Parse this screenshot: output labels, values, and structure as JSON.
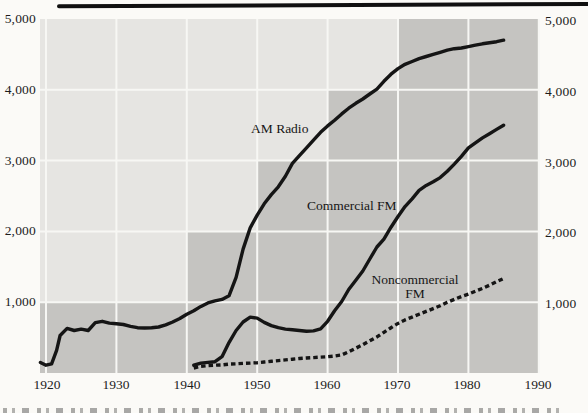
{
  "figure": {
    "description": "Scanned textbook line chart of U.S. radio stations by type, 1920-1990",
    "top_rule_color": "#101010"
  },
  "chart_data": {
    "type": "line",
    "title": "",
    "xlabel": "",
    "ylabel": "",
    "xlim": [
      1919,
      1990
    ],
    "ylim": [
      0,
      5000
    ],
    "grid": "white gridlines at each decade and each 1,000",
    "legend_position": "inline curve annotations",
    "x_ticks": [
      "1920",
      "1930",
      "1940",
      "1950",
      "1960",
      "1970",
      "1980",
      "1990"
    ],
    "x_tick_years": [
      1920,
      1930,
      1940,
      1950,
      1960,
      1970,
      1980,
      1990
    ],
    "y_ticks_left": [
      "5,000",
      "4,000",
      "3,000",
      "2,000",
      "1,000"
    ],
    "y_ticks_right": [
      "5,000",
      "4,000",
      "3,000",
      "2,000",
      "1,000"
    ],
    "y_tick_values": [
      5000,
      4000,
      3000,
      2000,
      1000
    ],
    "gridline_years": [
      1920,
      1930,
      1940,
      1950,
      1960,
      1970,
      1980,
      1990
    ],
    "gridline_values": [
      1000,
      2000,
      3000,
      4000
    ],
    "colors": {
      "plot_light": "#e6e5e2",
      "plot_dark": "#c5c4c1",
      "gridline": "#f7f7f4",
      "line": "#151515",
      "page": "#fbfaf7",
      "text": "#1c1c1c"
    },
    "background_steps": [
      {
        "band_low": 0,
        "band_high": 1000,
        "start_year": 1919
      },
      {
        "band_low": 1000,
        "band_high": 2000,
        "start_year": 1940
      },
      {
        "band_low": 2000,
        "band_high": 3000,
        "start_year": 1950
      },
      {
        "band_low": 3000,
        "band_high": 4000,
        "start_year": 1960
      },
      {
        "band_low": 4000,
        "band_high": 5000,
        "start_year": 1970
      }
    ],
    "annotations": [
      {
        "text": "AM Radio"
      },
      {
        "text": "Commercial FM"
      },
      {
        "text": "Noncommercial"
      },
      {
        "text": "FM"
      }
    ],
    "series": [
      {
        "name": "AM Radio",
        "line_style": "solid",
        "points": [
          [
            1919.2,
            150
          ],
          [
            1920,
            110
          ],
          [
            1920.8,
            130
          ],
          [
            1921.5,
            320
          ],
          [
            1922,
            530
          ],
          [
            1923,
            630
          ],
          [
            1924,
            600
          ],
          [
            1925,
            620
          ],
          [
            1926,
            600
          ],
          [
            1927,
            710
          ],
          [
            1928,
            730
          ],
          [
            1929,
            705
          ],
          [
            1930,
            695
          ],
          [
            1931,
            685
          ],
          [
            1932,
            660
          ],
          [
            1933,
            640
          ],
          [
            1934,
            635
          ],
          [
            1935,
            640
          ],
          [
            1936,
            650
          ],
          [
            1937,
            680
          ],
          [
            1938,
            720
          ],
          [
            1939,
            770
          ],
          [
            1940,
            830
          ],
          [
            1941,
            880
          ],
          [
            1942,
            940
          ],
          [
            1943,
            990
          ],
          [
            1944,
            1020
          ],
          [
            1945,
            1040
          ],
          [
            1946,
            1090
          ],
          [
            1947,
            1350
          ],
          [
            1948,
            1750
          ],
          [
            1949,
            2050
          ],
          [
            1950,
            2230
          ],
          [
            1951,
            2390
          ],
          [
            1952,
            2520
          ],
          [
            1953,
            2630
          ],
          [
            1954,
            2780
          ],
          [
            1955,
            2960
          ],
          [
            1956,
            3070
          ],
          [
            1957,
            3180
          ],
          [
            1958,
            3290
          ],
          [
            1959,
            3400
          ],
          [
            1960,
            3490
          ],
          [
            1961,
            3570
          ],
          [
            1962,
            3660
          ],
          [
            1963,
            3740
          ],
          [
            1964,
            3810
          ],
          [
            1965,
            3870
          ],
          [
            1966,
            3940
          ],
          [
            1967,
            4010
          ],
          [
            1968,
            4120
          ],
          [
            1969,
            4220
          ],
          [
            1970,
            4300
          ],
          [
            1971,
            4360
          ],
          [
            1972,
            4400
          ],
          [
            1973,
            4440
          ],
          [
            1974,
            4470
          ],
          [
            1975,
            4500
          ],
          [
            1976,
            4530
          ],
          [
            1977,
            4560
          ],
          [
            1978,
            4580
          ],
          [
            1979,
            4590
          ],
          [
            1980,
            4610
          ],
          [
            1981,
            4630
          ],
          [
            1982,
            4650
          ],
          [
            1983,
            4665
          ],
          [
            1984,
            4680
          ],
          [
            1985,
            4700
          ]
        ]
      },
      {
        "name": "Commercial FM",
        "line_style": "solid",
        "points": [
          [
            1941,
            110
          ],
          [
            1942,
            140
          ],
          [
            1943,
            150
          ],
          [
            1944,
            160
          ],
          [
            1945,
            230
          ],
          [
            1946,
            430
          ],
          [
            1947,
            600
          ],
          [
            1948,
            720
          ],
          [
            1949,
            790
          ],
          [
            1950,
            775
          ],
          [
            1951,
            715
          ],
          [
            1952,
            670
          ],
          [
            1953,
            640
          ],
          [
            1954,
            620
          ],
          [
            1955,
            610
          ],
          [
            1956,
            600
          ],
          [
            1957,
            590
          ],
          [
            1958,
            595
          ],
          [
            1959,
            625
          ],
          [
            1960,
            730
          ],
          [
            1961,
            880
          ],
          [
            1962,
            1010
          ],
          [
            1963,
            1180
          ],
          [
            1964,
            1310
          ],
          [
            1965,
            1440
          ],
          [
            1966,
            1610
          ],
          [
            1967,
            1780
          ],
          [
            1968,
            1890
          ],
          [
            1969,
            2060
          ],
          [
            1970,
            2210
          ],
          [
            1971,
            2350
          ],
          [
            1972,
            2460
          ],
          [
            1973,
            2580
          ],
          [
            1974,
            2650
          ],
          [
            1975,
            2700
          ],
          [
            1976,
            2760
          ],
          [
            1977,
            2850
          ],
          [
            1978,
            2950
          ],
          [
            1979,
            3060
          ],
          [
            1980,
            3180
          ],
          [
            1981,
            3250
          ],
          [
            1982,
            3320
          ],
          [
            1983,
            3380
          ],
          [
            1984,
            3440
          ],
          [
            1985,
            3500
          ]
        ]
      },
      {
        "name": "Noncommercial FM",
        "line_style": "dashed",
        "points": [
          [
            1941,
            70
          ],
          [
            1942,
            95
          ],
          [
            1943,
            105
          ],
          [
            1944,
            110
          ],
          [
            1945,
            115
          ],
          [
            1946,
            125
          ],
          [
            1947,
            130
          ],
          [
            1948,
            135
          ],
          [
            1949,
            140
          ],
          [
            1950,
            145
          ],
          [
            1951,
            155
          ],
          [
            1952,
            165
          ],
          [
            1953,
            175
          ],
          [
            1954,
            185
          ],
          [
            1955,
            195
          ],
          [
            1956,
            205
          ],
          [
            1957,
            212
          ],
          [
            1958,
            218
          ],
          [
            1959,
            224
          ],
          [
            1960,
            230
          ],
          [
            1961,
            240
          ],
          [
            1962,
            255
          ],
          [
            1963,
            300
          ],
          [
            1964,
            350
          ],
          [
            1965,
            400
          ],
          [
            1966,
            455
          ],
          [
            1967,
            510
          ],
          [
            1968,
            575
          ],
          [
            1969,
            640
          ],
          [
            1970,
            700
          ],
          [
            1971,
            750
          ],
          [
            1972,
            790
          ],
          [
            1973,
            830
          ],
          [
            1974,
            870
          ],
          [
            1975,
            910
          ],
          [
            1976,
            950
          ],
          [
            1977,
            1000
          ],
          [
            1978,
            1040
          ],
          [
            1979,
            1080
          ],
          [
            1980,
            1115
          ],
          [
            1981,
            1155
          ],
          [
            1982,
            1195
          ],
          [
            1983,
            1240
          ],
          [
            1984,
            1290
          ],
          [
            1985,
            1335
          ]
        ]
      }
    ]
  }
}
